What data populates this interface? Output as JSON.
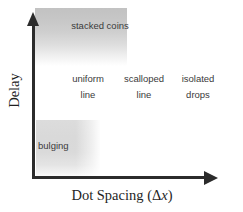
{
  "figure": {
    "axes": {
      "y_title": "Delay",
      "x_title_text": "Dot Spacing (",
      "x_title_symbol": "Δ",
      "x_title_variable": "x",
      "x_title_close": ")"
    },
    "regions": [
      {
        "name": "stacked-coins",
        "label_line1": "stacked coins",
        "label_line2": "",
        "shading": "gradient",
        "color_top": "#c2c2c2",
        "color_bottom": "#ffffff"
      },
      {
        "name": "bulging",
        "label_line1": "bulging",
        "label_line2": "",
        "shading": "gradient",
        "color_top": "#dcdcdc",
        "color_bottom": "#ffffff"
      }
    ],
    "regime_labels": [
      {
        "name": "uniform-line",
        "line1": "uniform",
        "line2": "line"
      },
      {
        "name": "scalloped-line",
        "line1": "scalloped",
        "line2": "line"
      },
      {
        "name": "isolated-drops",
        "line1": "isolated",
        "line2": "drops"
      }
    ],
    "colors": {
      "axis": "#2b2b2b",
      "text": "#3a3a3a",
      "background": "#ffffff"
    }
  }
}
